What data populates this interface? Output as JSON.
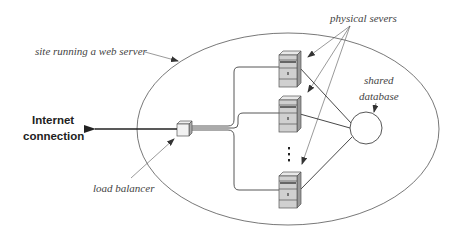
{
  "diagram": {
    "labels": {
      "site": "site running a web server",
      "servers": "physical severs",
      "database_line1": "shared",
      "database_line2": "database",
      "internet_line1": "Internet",
      "internet_line2": "connection",
      "load_balancer": "load balancer"
    },
    "ellipsis": "⋮",
    "nodes": [
      {
        "id": "internet",
        "type": "external-connection"
      },
      {
        "id": "load-balancer",
        "type": "switch"
      },
      {
        "id": "server-1",
        "type": "physical-server"
      },
      {
        "id": "server-2",
        "type": "physical-server"
      },
      {
        "id": "server-n",
        "type": "physical-server"
      },
      {
        "id": "shared-db",
        "type": "database"
      }
    ],
    "edges": [
      {
        "from": "load-balancer",
        "to": "internet",
        "directed": true
      },
      {
        "from": "load-balancer",
        "to": "server-1"
      },
      {
        "from": "load-balancer",
        "to": "server-2"
      },
      {
        "from": "load-balancer",
        "to": "server-n"
      },
      {
        "from": "server-1",
        "to": "shared-db"
      },
      {
        "from": "server-2",
        "to": "shared-db"
      },
      {
        "from": "server-n",
        "to": "shared-db"
      }
    ],
    "colors": {
      "stroke": "#333333",
      "thin_stroke": "#666666",
      "server_front": "#d4d4d4",
      "server_side": "#9a9a9a",
      "server_top": "#e6e6e6",
      "text": "#444444"
    }
  }
}
